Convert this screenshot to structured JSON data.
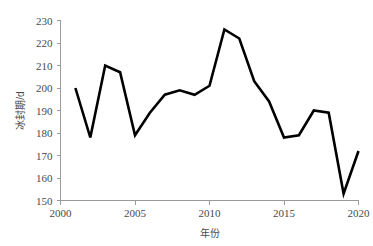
{
  "chart_data": {
    "type": "line",
    "title": "",
    "xlabel": "年份",
    "ylabel": "冰封期/d",
    "xlim": [
      2000,
      2020
    ],
    "ylim": [
      150,
      230
    ],
    "ytick_step": 10,
    "xtick_step": 5,
    "grid": false,
    "legend": null,
    "legend_position": "none",
    "line_color": "#000000",
    "axis_color": "#9a9a9a",
    "text_color": "#4a4a4a",
    "x": [
      2001,
      2002,
      2003,
      2004,
      2005,
      2006,
      2007,
      2008,
      2009,
      2010,
      2011,
      2012,
      2013,
      2014,
      2015,
      2016,
      2017,
      2018,
      2019,
      2020
    ],
    "values": [
      200,
      178,
      210,
      207,
      179,
      189,
      197,
      199,
      197,
      201,
      226,
      222,
      203,
      194,
      178,
      179,
      190,
      189,
      153,
      172
    ],
    "series": [
      {
        "name": "冰封期",
        "values": [
          200,
          178,
          210,
          207,
          179,
          189,
          197,
          199,
          197,
          201,
          226,
          222,
          203,
          194,
          178,
          179,
          190,
          189,
          153,
          172
        ]
      }
    ],
    "xticks": [
      2000,
      2005,
      2010,
      2015,
      2020
    ],
    "xtick_labels": [
      "2000",
      "2005",
      "2010",
      "2015",
      "2020"
    ],
    "yticks": [
      150,
      160,
      170,
      180,
      190,
      200,
      210,
      220,
      230
    ],
    "ytick_labels": [
      "150",
      "160",
      "170",
      "180",
      "190",
      "200",
      "210",
      "220",
      "230"
    ]
  }
}
